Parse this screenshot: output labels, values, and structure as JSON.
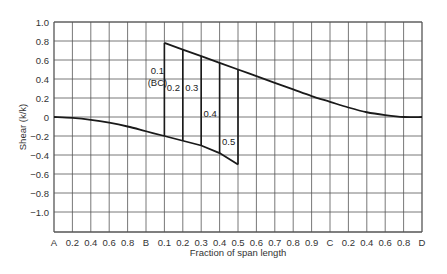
{
  "chart_data": {
    "type": "line",
    "title": "",
    "xlabel": "Fraction of span length",
    "ylabel": "Shear (k/k)",
    "ylim": [
      -1.2,
      1.0
    ],
    "grid": true,
    "legend": null,
    "x_tick_labels": [
      "A",
      "0.2",
      "0.4",
      "0.6",
      "0.8",
      "B",
      "0.1",
      "0.2",
      "0.3",
      "0.4",
      "0.5",
      "0.6",
      "0.7",
      "0.8",
      "0.9",
      "C",
      "0.2",
      "0.4",
      "0.6",
      "0.8",
      "D"
    ],
    "y_tick_labels": [
      "1.0",
      "0.8",
      "0.6",
      "0.4",
      "0.2",
      "0",
      "-0.2",
      "-0.4",
      "-0.6",
      "-0.8",
      "-1.0"
    ],
    "y_ticks": [
      1.0,
      0.8,
      0.6,
      0.4,
      0.2,
      0,
      -0.2,
      -0.4,
      -0.6,
      -0.8,
      -1.0
    ],
    "series": [
      {
        "name": "Lower envelope (A to BC 0.5)",
        "x_index": [
          0,
          1,
          2,
          3,
          4,
          5,
          6,
          7,
          8,
          9,
          10
        ],
        "values": [
          0.0,
          -0.01,
          -0.03,
          -0.06,
          -0.1,
          -0.15,
          -0.2,
          -0.25,
          -0.3,
          -0.38,
          -0.5
        ]
      },
      {
        "name": "Upper envelope (BC 0.1 to D)",
        "x_index": [
          6,
          7,
          8,
          9,
          10,
          11,
          12,
          13,
          14,
          15,
          16,
          17,
          18,
          19,
          20
        ],
        "values": [
          0.78,
          0.71,
          0.64,
          0.57,
          0.5,
          0.43,
          0.36,
          0.29,
          0.22,
          0.16,
          0.1,
          0.05,
          0.02,
          0.0,
          0.0
        ]
      }
    ],
    "influence_lines": [
      {
        "label": "0.1\n(BC)",
        "x_index": 6,
        "top": 0.78,
        "bottom": -0.2
      },
      {
        "label": "0.2",
        "x_index": 7,
        "top": 0.71,
        "bottom": -0.25
      },
      {
        "label": "0.3",
        "x_index": 8,
        "top": 0.64,
        "bottom": -0.3
      },
      {
        "label": "0.4",
        "x_index": 9,
        "top": 0.57,
        "bottom": -0.38
      },
      {
        "label": "0.5",
        "x_index": 10,
        "top": 0.5,
        "bottom": -0.5
      }
    ],
    "annotations": [
      "0.1",
      "(BC)",
      "0.2",
      "0.3",
      "0.4",
      "0.5"
    ]
  },
  "colors": {
    "grid": "#555555",
    "curve": "#1a1a1a",
    "text": "#333333"
  }
}
